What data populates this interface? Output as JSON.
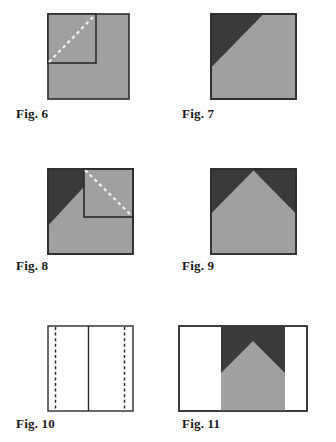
{
  "document": {
    "kind": "figure-plate",
    "background_color": "#ffffff",
    "width": 336,
    "height": 442
  },
  "palette": {
    "grey_fill": "#a0a0a0",
    "dark_fill": "#3a3a3a",
    "white_fill": "#ffffff",
    "outline": "#2b2b2b",
    "dash_light": "#f2f2f2",
    "label_color": "#1a1a1a"
  },
  "figures": [
    {
      "id": "fig6",
      "label": "Fig. 6",
      "caption_x": 16,
      "caption_y": 106,
      "frame": {
        "x": 47,
        "y": 13,
        "w": 81,
        "h": 85
      },
      "description": "Grey square with inner grey square outlined in upper-left and a white dashed diagonal fold line across the inner square",
      "shapes": [
        {
          "name": "outer-square",
          "fill": "grey_fill",
          "stroke": "outline"
        },
        {
          "name": "inner-square",
          "fill": "grey_fill",
          "stroke": "outline",
          "x": 47,
          "y": 13,
          "w": 48,
          "h": 49
        },
        {
          "name": "fold-dashed-diagonal",
          "stroke": "dash_light",
          "from": [
            47,
            62
          ],
          "to": [
            95,
            13
          ]
        }
      ]
    },
    {
      "id": "fig7",
      "label": "Fig. 7",
      "caption_x": 182,
      "caption_y": 106,
      "frame": {
        "x": 210,
        "y": 13,
        "w": 85,
        "h": 85
      },
      "description": "Grey square with a dark triangle occupying the upper-left corner",
      "shapes": [
        {
          "name": "outer-square",
          "fill": "grey_fill",
          "stroke": "outline"
        },
        {
          "name": "dark-corner-triangle",
          "fill": "dark_fill",
          "points": [
            [
              210,
              13
            ],
            [
              262,
              13
            ],
            [
              210,
              66
            ]
          ]
        }
      ]
    },
    {
      "id": "fig8",
      "label": "Fig. 8",
      "caption_x": 16,
      "caption_y": 258,
      "frame": {
        "x": 47,
        "y": 168,
        "w": 85,
        "h": 85
      },
      "description": "Grey square with dark triangle in the upper-left corner, an inner square outlined in the upper-right, and a white dashed diagonal across the inner square",
      "shapes": [
        {
          "name": "outer-square",
          "fill": "grey_fill",
          "stroke": "outline"
        },
        {
          "name": "dark-corner-triangle",
          "fill": "dark_fill",
          "points": [
            [
              47,
              168
            ],
            [
              47,
              224
            ],
            [
              99,
              168
            ]
          ]
        },
        {
          "name": "inner-square",
          "fill": "grey_fill",
          "stroke": "outline",
          "x": 84,
          "y": 168,
          "w": 48,
          "h": 48
        },
        {
          "name": "fold-dashed-diagonal",
          "stroke": "dash_light",
          "from": [
            84,
            168
          ],
          "to": [
            132,
            216
          ]
        }
      ]
    },
    {
      "id": "fig9",
      "label": "Fig. 9",
      "caption_x": 182,
      "caption_y": 258,
      "frame": {
        "x": 210,
        "y": 168,
        "w": 85,
        "h": 85
      },
      "description": "Square with a grey house/pentagon shape and dark triangles filling both upper corners",
      "shapes": [
        {
          "name": "dark-background",
          "fill": "dark_fill"
        },
        {
          "name": "grey-house-pentagon",
          "fill": "grey_fill",
          "points": [
            [
              210,
              253
            ],
            [
              210,
              212
            ],
            [
              252,
              170
            ],
            [
              295,
              212
            ],
            [
              295,
              253
            ]
          ]
        },
        {
          "name": "outer-square-outline",
          "stroke": "outline"
        }
      ]
    },
    {
      "id": "fig10",
      "label": "Fig. 10",
      "caption_x": 16,
      "caption_y": 416,
      "frame": {
        "x": 47,
        "y": 325,
        "w": 85,
        "h": 85
      },
      "description": "White square outlined, with a solid vertical centre line and two dashed vertical lines near the left and right edges",
      "shapes": [
        {
          "name": "outer-square",
          "fill": "white_fill",
          "stroke": "outline"
        },
        {
          "name": "centre-vertical-line",
          "stroke": "outline",
          "x": 88
        },
        {
          "name": "left-dashed-vertical",
          "stroke": "outline",
          "x": 55
        },
        {
          "name": "right-dashed-vertical",
          "stroke": "outline",
          "x": 124
        }
      ]
    },
    {
      "id": "fig11",
      "label": "Fig. 11",
      "caption_x": 182,
      "caption_y": 416,
      "frame": {
        "x": 178,
        "y": 325,
        "w": 128,
        "h": 85
      },
      "description": "Wide white rectangle with the grey house and dark upper corners pattern occupying the central band",
      "shapes": [
        {
          "name": "outer-rectangle",
          "fill": "white_fill",
          "stroke": "outline"
        },
        {
          "name": "dark-centre-band",
          "fill": "dark_fill",
          "x": 221,
          "y": 325,
          "w": 64,
          "h": 85
        },
        {
          "name": "grey-house-pentagon",
          "fill": "grey_fill",
          "points": [
            [
              221,
              410
            ],
            [
              221,
              373
            ],
            [
              253,
              341
            ],
            [
              285,
              373
            ],
            [
              285,
              410
            ]
          ]
        }
      ]
    }
  ]
}
